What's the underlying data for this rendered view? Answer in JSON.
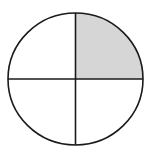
{
  "diagram": {
    "type": "fraction-circle",
    "total_parts": 4,
    "shaded_parts": 1,
    "shaded_quadrant": "top-right",
    "colors": {
      "background": "#ffffff",
      "stroke": "#1a1a1a",
      "shaded_fill": "#d6d6d6"
    }
  }
}
